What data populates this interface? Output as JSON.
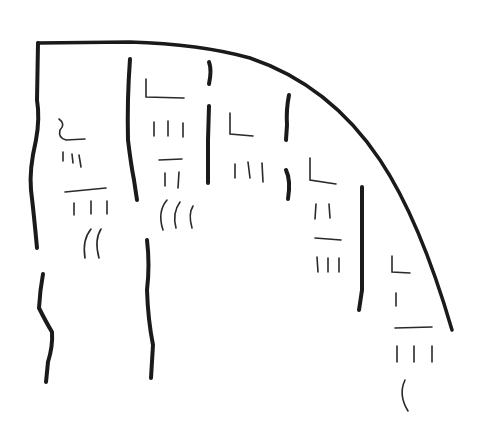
{
  "diagram": {
    "stroke_color": "#1a1a1a",
    "background": "#ffffff",
    "columns": [
      {
        "id": "col-1",
        "glyphs": [
          "L-mark",
          "three-ticks",
          "dash",
          "three-ticks",
          "two-arcs"
        ]
      },
      {
        "id": "col-2",
        "glyphs": [
          "L-mark",
          "three-ticks",
          "dash",
          "two-ticks",
          "three-arcs"
        ]
      },
      {
        "id": "col-3",
        "glyphs": [
          "L-mark",
          "three-ticks"
        ]
      },
      {
        "id": "col-4",
        "glyphs": [
          "L-mark",
          "two-ticks",
          "dash",
          "three-ticks"
        ]
      },
      {
        "id": "col-5",
        "glyphs": [
          "L-mark",
          "one-tick",
          "dash",
          "three-ticks",
          "arc"
        ]
      }
    ]
  }
}
